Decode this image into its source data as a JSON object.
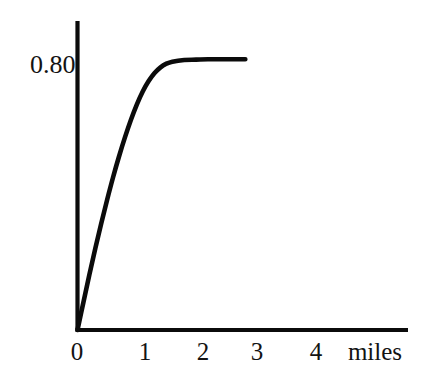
{
  "chart_data": {
    "type": "line",
    "title": "",
    "subtitle": "",
    "xlabel": "miles",
    "ylabel": "",
    "xlim": [
      0,
      5.25
    ],
    "ylim": [
      0,
      0.885
    ],
    "grid": false,
    "legend": null,
    "x_tick_labels": [
      "0",
      "1",
      "2",
      "3",
      "4"
    ],
    "x_ticks": [
      0,
      1,
      2,
      3,
      4
    ],
    "y_tick_labels": [
      "0.80"
    ],
    "y_ticks": [
      0.8
    ],
    "annotations": [],
    "series": [
      {
        "name": "concentration",
        "x": [
          0,
          0.1,
          0.2,
          0.3,
          0.4,
          0.5,
          0.6,
          0.7,
          0.8,
          0.9,
          1.0,
          1.1,
          1.2,
          1.3,
          1.4,
          1.5,
          1.6,
          1.8,
          2.0,
          2.2,
          2.4,
          2.6,
          2.8
        ],
        "values": [
          0,
          0.083,
          0.165,
          0.243,
          0.318,
          0.389,
          0.456,
          0.518,
          0.575,
          0.627,
          0.673,
          0.712,
          0.743,
          0.767,
          0.784,
          0.795,
          0.801,
          0.806,
          0.807,
          0.808,
          0.808,
          0.808,
          0.808
        ]
      }
    ],
    "asymptote_value": 0.8,
    "curve_end_x": 2.83
  },
  "axes": {
    "y_value_label": "0.80",
    "x_labels": [
      {
        "text": "0",
        "value": 0
      },
      {
        "text": "1",
        "value": 1
      },
      {
        "text": "2",
        "value": 2
      },
      {
        "text": "3",
        "value": 3
      },
      {
        "text": "4",
        "value": 4
      }
    ],
    "x_unit_label": "miles"
  },
  "style": {
    "background_color": "#ffffff",
    "ink_color": "#0b0b0b",
    "text_color": "#131313"
  }
}
